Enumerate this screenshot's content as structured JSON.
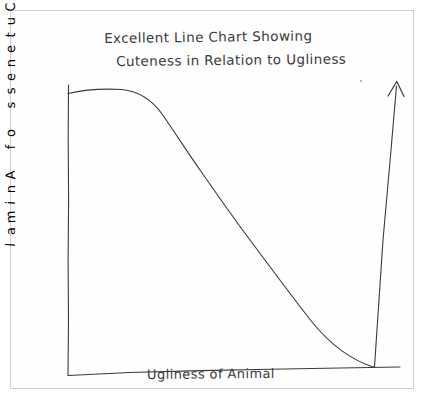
{
  "page": {
    "background_color": "#ffffff",
    "ink_color": "#333333",
    "frame_color": "#cfcfcf"
  },
  "chart_data": {
    "type": "line",
    "title": "Excellent Line Chart Showing Cuteness in Relation to Ugliness",
    "title_lines": [
      "Excellent Line Chart Showing",
      "Cuteness in Relation to Ugliness"
    ],
    "xlabel": "Ugliness of Animal",
    "ylabel": "Cuteness of Animal",
    "style": "hand-drawn",
    "grid": false,
    "legend": false,
    "xlim": [
      0,
      100
    ],
    "ylim": [
      0,
      100
    ],
    "x_tick_labels": [],
    "y_tick_labels": [],
    "annotations": [
      {
        "name": "terminal-arrowhead",
        "text": "",
        "description": "upward arrowhead at end of curve"
      }
    ],
    "series": [
      {
        "name": "Cuteness",
        "x": [
          0,
          8,
          16,
          24,
          32,
          40,
          48,
          56,
          64,
          72,
          80,
          88,
          92,
          92,
          92
        ],
        "values": [
          97,
          99,
          99,
          95,
          86,
          74,
          62,
          50,
          38,
          26,
          15,
          4,
          0,
          50,
          100
        ]
      }
    ],
    "curve_points": {
      "description": "Cuteness starts maximal, plateaus briefly, declines steadily to zero at high ugliness, then spikes vertically upward off-chart",
      "plateau_end_x": 16,
      "zero_crossing_x": 92,
      "spike_top_y": 100
    }
  },
  "axes": {
    "y_axis_name": "cuteness-axis",
    "x_axis_name": "ugliness-axis"
  },
  "y_axis_chars": [
    "C",
    "u",
    "t",
    "e",
    "n",
    "e",
    "s",
    "s",
    "",
    "o",
    "f",
    "",
    "A",
    "n",
    "i",
    "m",
    "a",
    "l"
  ]
}
